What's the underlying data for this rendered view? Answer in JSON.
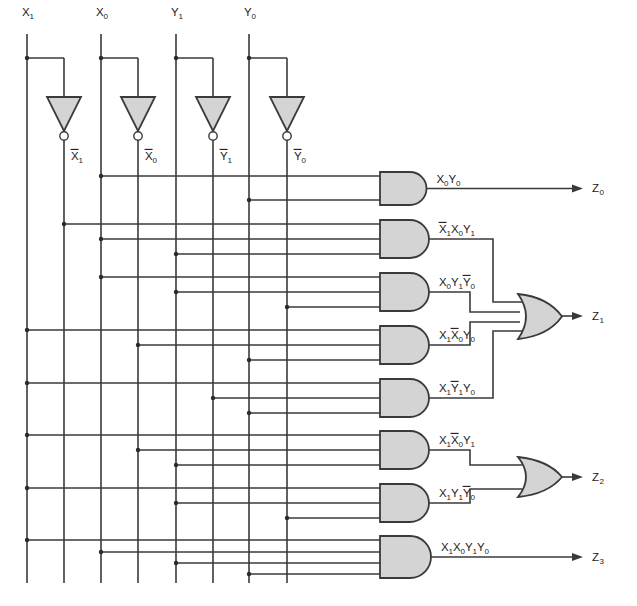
{
  "diagram": {
    "colors": {
      "wire": "#3a3a3a",
      "gate_fill": "#d4d4d4",
      "gate_stroke": "#3a3a3a",
      "text": "#1a1a1a",
      "background": "#ffffff"
    }
  },
  "inputs": [
    {
      "name": "X1",
      "base": "X",
      "sub": "1",
      "x": 27
    },
    {
      "name": "X0",
      "base": "X",
      "sub": "0",
      "x": 101
    },
    {
      "name": "Y1",
      "base": "Y",
      "sub": "1",
      "x": 176
    },
    {
      "name": "Y0",
      "base": "Y",
      "sub": "0",
      "x": 249
    }
  ],
  "inverters": [
    {
      "name": "not-X1",
      "label_base": "X",
      "label_sub": "1",
      "overbar": true,
      "x": 64
    },
    {
      "name": "not-X0",
      "label_base": "X",
      "label_sub": "0",
      "overbar": true,
      "x": 138
    },
    {
      "name": "not-Y1",
      "label_base": "Y",
      "label_sub": "1",
      "overbar": true,
      "x": 213
    },
    {
      "name": "not-Y0",
      "label_base": "Y",
      "label_sub": "0",
      "overbar": true,
      "x": 287
    }
  ],
  "bus_lines": [
    {
      "signal": "X1",
      "x": 27,
      "overbar": false
    },
    {
      "signal": "X1b",
      "x": 64,
      "overbar": true
    },
    {
      "signal": "X0",
      "x": 101,
      "overbar": false
    },
    {
      "signal": "X0b",
      "x": 138,
      "overbar": true
    },
    {
      "signal": "Y1",
      "x": 176,
      "overbar": false
    },
    {
      "signal": "Y1b",
      "x": 213,
      "overbar": true
    },
    {
      "signal": "Y0",
      "x": 249,
      "overbar": false
    },
    {
      "signal": "Y0b",
      "x": 287,
      "overbar": true
    }
  ],
  "and_gates": [
    {
      "id": "and-1",
      "label_tokens": [
        [
          "X",
          "0",
          false
        ],
        [
          "Y",
          "0",
          false
        ]
      ],
      "top": 172,
      "bottom": 205,
      "inputs": [
        {
          "x": 101,
          "y": 176
        },
        {
          "x": 249,
          "y": 200
        }
      ]
    },
    {
      "id": "and-2",
      "label_tokens": [
        [
          "X",
          "1",
          true
        ],
        [
          "X",
          "0",
          false
        ],
        [
          "Y",
          "1",
          false
        ]
      ],
      "top": 220,
      "bottom": 258,
      "inputs": [
        {
          "x": 64,
          "y": 224
        },
        {
          "x": 101,
          "y": 239
        },
        {
          "x": 176,
          "y": 254
        }
      ]
    },
    {
      "id": "and-3",
      "label_tokens": [
        [
          "X",
          "0",
          false
        ],
        [
          "Y",
          "1",
          false
        ],
        [
          "Y",
          "0",
          true
        ]
      ],
      "top": 273,
      "bottom": 311,
      "inputs": [
        {
          "x": 101,
          "y": 277
        },
        {
          "x": 176,
          "y": 292
        },
        {
          "x": 287,
          "y": 307
        }
      ]
    },
    {
      "id": "and-4",
      "label_tokens": [
        [
          "X",
          "1",
          false
        ],
        [
          "X",
          "0",
          true
        ],
        [
          "Y",
          "0",
          false
        ]
      ],
      "top": 326,
      "bottom": 364,
      "inputs": [
        {
          "x": 27,
          "y": 330
        },
        {
          "x": 138,
          "y": 345
        },
        {
          "x": 249,
          "y": 360
        }
      ]
    },
    {
      "id": "and-5",
      "label_tokens": [
        [
          "X",
          "1",
          false
        ],
        [
          "Y",
          "1",
          true
        ],
        [
          "Y",
          "0",
          false
        ]
      ],
      "top": 379,
      "bottom": 417,
      "inputs": [
        {
          "x": 27,
          "y": 383
        },
        {
          "x": 213,
          "y": 398
        },
        {
          "x": 249,
          "y": 413
        }
      ]
    },
    {
      "id": "and-6",
      "label_tokens": [
        [
          "X",
          "1",
          false
        ],
        [
          "X",
          "0",
          true
        ],
        [
          "Y",
          "1",
          false
        ]
      ],
      "top": 431,
      "bottom": 469,
      "inputs": [
        {
          "x": 27,
          "y": 435
        },
        {
          "x": 138,
          "y": 450
        },
        {
          "x": 176,
          "y": 465
        }
      ]
    },
    {
      "id": "and-7",
      "label_tokens": [
        [
          "X",
          "1",
          false
        ],
        [
          "Y",
          "1",
          false
        ],
        [
          "Y",
          "0",
          true
        ]
      ],
      "top": 484,
      "bottom": 522,
      "inputs": [
        {
          "x": 27,
          "y": 488
        },
        {
          "x": 176,
          "y": 503
        },
        {
          "x": 287,
          "y": 518
        }
      ]
    },
    {
      "id": "and-8",
      "label_tokens": [
        [
          "X",
          "1",
          false
        ],
        [
          "X",
          "0",
          false
        ],
        [
          "Y",
          "1",
          false
        ],
        [
          "Y",
          "0",
          false
        ]
      ],
      "top": 536,
      "bottom": 578,
      "inputs": [
        {
          "x": 27,
          "y": 540
        },
        {
          "x": 101,
          "y": 552
        },
        {
          "x": 176,
          "y": 563
        },
        {
          "x": 249,
          "y": 574
        }
      ]
    }
  ],
  "or_gates": [
    {
      "id": "or-z1",
      "top": 294,
      "bottom": 339,
      "left": 518,
      "right": 562,
      "out_y": 316
    },
    {
      "id": "or-z2",
      "top": 457,
      "bottom": 497,
      "left": 518,
      "right": 562,
      "out_y": 477
    }
  ],
  "outputs": [
    {
      "name": "Z0",
      "base": "Z",
      "sub": "0",
      "x": 592,
      "y": 188
    },
    {
      "name": "Z1",
      "base": "Z",
      "sub": "1",
      "x": 592,
      "y": 316
    },
    {
      "name": "Z2",
      "base": "Z",
      "sub": "2",
      "x": 592,
      "y": 477
    },
    {
      "name": "Z3",
      "base": "Z",
      "sub": "3",
      "x": 592,
      "y": 557
    }
  ],
  "equations": {
    "Z0": "X0Y0",
    "Z1": "X1'X0Y1 + X0Y1Y0' + X1X0'Y0 + X1Y1'Y0",
    "Z2": "X1X0'Y1 + X1Y1Y0'",
    "Z3": "X1X0Y1Y0"
  }
}
